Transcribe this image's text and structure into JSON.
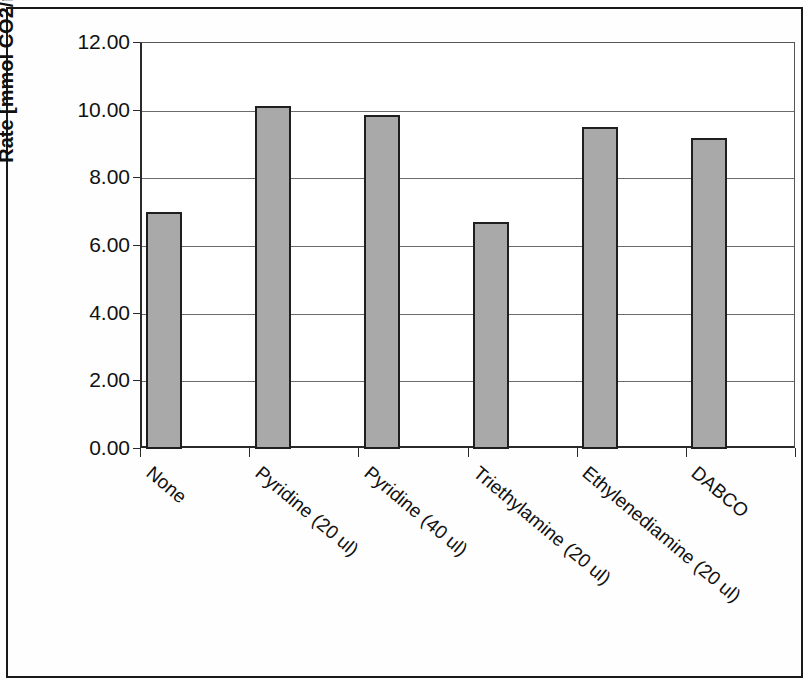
{
  "chart_data": {
    "type": "bar",
    "title": "",
    "xlabel": "",
    "ylabel": "Rate [mmol CO2/min g cat]",
    "categories": [
      "None",
      "Pyridine (20 ul)",
      "Pyridine (40 ul)",
      "Triethylamine (20 ul)",
      "Ethylenediamine (20 ul)",
      "DABCO"
    ],
    "values": [
      7.0,
      10.15,
      9.88,
      6.72,
      9.52,
      9.18
    ],
    "ylim": [
      0.0,
      12.0
    ],
    "ytick_labels": [
      "12.00",
      "10.00",
      "8.00",
      "6.00",
      "4.00",
      "2.00",
      "0.00"
    ],
    "ytick_values": [
      12,
      10,
      8,
      6,
      4,
      2,
      0
    ],
    "grid": "horizontal",
    "legend": "none",
    "bar_color": "#a9a9a9",
    "bar_edge_color": "#1f1f1f",
    "axis_color": "#2a2a2a",
    "grid_color": "#6b6b6b",
    "background_color": "#ffffff",
    "frame_color": "#1a1a1a"
  }
}
